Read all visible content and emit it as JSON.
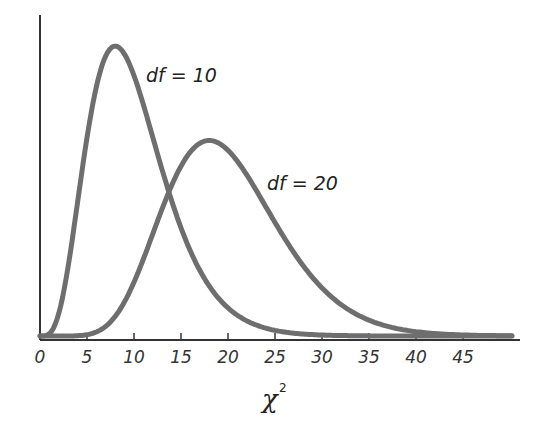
{
  "chart_data": {
    "type": "line",
    "title": "",
    "xlabel": "χ²",
    "xlabel_base": "χ",
    "xlabel_sup": "2",
    "ylabel": "",
    "xlim": [
      0,
      51
    ],
    "ylim": [
      0,
      0.1
    ],
    "grid": false,
    "legend": "none (inline curve labels)",
    "x_ticks": [
      0,
      5,
      10,
      15,
      20,
      25,
      30,
      35,
      40,
      45
    ],
    "x_tick_labels": [
      "0",
      "5",
      "10",
      "15",
      "20",
      "25",
      "30",
      "35",
      "40",
      "45"
    ],
    "series": [
      {
        "name": "df = 10",
        "label": "df = 10",
        "df": 10,
        "peak": {
          "x": 8,
          "y": 0.0977
        },
        "x": [
          0,
          2,
          4,
          6,
          8,
          10,
          12,
          14,
          16,
          18,
          20,
          25,
          30,
          35,
          40,
          45,
          50
        ],
        "values": [
          0,
          0.0153,
          0.0361,
          0.0504,
          0.0977,
          0.0877,
          0.0715,
          0.051,
          0.0335,
          0.0206,
          0.0119,
          0.0029,
          0.0006,
          0.0001,
          0.0,
          0.0,
          0.0
        ]
      },
      {
        "name": "df = 20",
        "label": "df = 20",
        "df": 20,
        "peak": {
          "x": 18,
          "y": 0.0679
        },
        "x": [
          0,
          5,
          8,
          10,
          12,
          14,
          16,
          18,
          20,
          22,
          25,
          30,
          35,
          40,
          45,
          50
        ],
        "values": [
          0,
          0.0003,
          0.0055,
          0.0181,
          0.0368,
          0.0548,
          0.0661,
          0.0679,
          0.0626,
          0.0536,
          0.0381,
          0.0177,
          0.0071,
          0.0026,
          0.0009,
          0.0003
        ]
      }
    ],
    "annotations": [
      {
        "text": "df = 10",
        "near_series": "df = 10"
      },
      {
        "text": "df = 20",
        "near_series": "df = 20"
      }
    ],
    "colors": {
      "curve": "#6e6e6e",
      "axis": "#333333",
      "background": "#ffffff"
    }
  }
}
